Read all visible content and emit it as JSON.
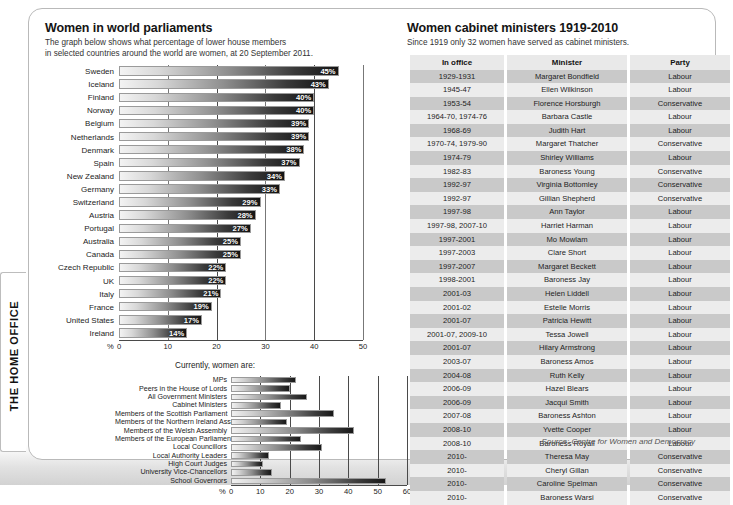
{
  "brand": {
    "tab_label": "THE HOME OFFICE"
  },
  "left": {
    "title": "Women in world parliaments",
    "subtitle_line1": "The graph below shows what percentage of lower house members",
    "subtitle_line2": "in selected countries around the world are women, at 20 September 2011.",
    "sub_caption": "Currently, women are:",
    "axis_unit": "%",
    "source": "Source: Centre for Women and Democracy"
  },
  "right": {
    "title": "Women cabinet ministers 1919-2010",
    "subtitle": "Since 1919 only 32 women have served as cabinet ministers.",
    "columns": [
      "In office",
      "Minister",
      "Party"
    ],
    "rows": [
      [
        "1929-1931",
        "Margaret Bondfield",
        "Labour"
      ],
      [
        "1945-47",
        "Ellen Wilkinson",
        "Labour"
      ],
      [
        "1953-54",
        "Florence Horsburgh",
        "Conservative"
      ],
      [
        "1964-70, 1974-76",
        "Barbara Castle",
        "Labour"
      ],
      [
        "1968-69",
        "Judith Hart",
        "Labour"
      ],
      [
        "1970-74, 1979-90",
        "Margaret Thatcher",
        "Conservative"
      ],
      [
        "1974-79",
        "Shirley Williams",
        "Labour"
      ],
      [
        "1982-83",
        "Baroness Young",
        "Conservative"
      ],
      [
        "1992-97",
        "Virginia Bottomley",
        "Conservative"
      ],
      [
        "1992-97",
        "Gillian Shepherd",
        "Conservative"
      ],
      [
        "1997-98",
        "Ann Taylor",
        "Labour"
      ],
      [
        "1997-98, 2007-10",
        "Harriet Harman",
        "Labour"
      ],
      [
        "1997-2001",
        "Mo Mowlam",
        "Labour"
      ],
      [
        "1997-2003",
        "Clare Short",
        "Labour"
      ],
      [
        "1997-2007",
        "Margaret Beckett",
        "Labour"
      ],
      [
        "1998-2001",
        "Baroness Jay",
        "Labour"
      ],
      [
        "2001-03",
        "Helen Liddell",
        "Labour"
      ],
      [
        "2001-02",
        "Estelle Morris",
        "Labour"
      ],
      [
        "2001-07",
        "Patricia Hewitt",
        "Labour"
      ],
      [
        "2001-07, 2009-10",
        "Tessa Jowell",
        "Labour"
      ],
      [
        "2001-07",
        "Hilary Armstrong",
        "Labour"
      ],
      [
        "2003-07",
        "Baroness Amos",
        "Labour"
      ],
      [
        "2004-08",
        "Ruth Kelly",
        "Labour"
      ],
      [
        "2006-09",
        "Hazel Blears",
        "Labour"
      ],
      [
        "2006-09",
        "Jacqui Smith",
        "Labour"
      ],
      [
        "2007-08",
        "Baroness Ashton",
        "Labour"
      ],
      [
        "2008-10",
        "Yvette Cooper",
        "Labour"
      ],
      [
        "2008-10",
        "Baroness Royall",
        "Labour"
      ],
      [
        "2010-",
        "Theresa May",
        "Conservative"
      ],
      [
        "2010-",
        "Cheryl Gillan",
        "Conservative"
      ],
      [
        "2010-",
        "Caroline Spelman",
        "Conservative"
      ],
      [
        "2010-",
        "Baroness Warsi",
        "Conservative"
      ]
    ]
  },
  "chart_data": [
    {
      "type": "bar",
      "orientation": "horizontal",
      "title": "Women in world parliaments",
      "xlabel": "%",
      "ylabel": "",
      "xlim": [
        0,
        50
      ],
      "xticks": [
        0,
        10,
        20,
        30,
        40,
        50
      ],
      "grid": true,
      "data_labels": true,
      "categories": [
        "Sweden",
        "Iceland",
        "Finland",
        "Norway",
        "Belgium",
        "Netherlands",
        "Denmark",
        "Spain",
        "New Zealand",
        "Germany",
        "Switzerland",
        "Austria",
        "Portugal",
        "Australia",
        "Canada",
        "Czech Republic",
        "UK",
        "Italy",
        "France",
        "United States",
        "Ireland"
      ],
      "values": [
        45,
        43,
        40,
        40,
        39,
        39,
        38,
        37,
        34,
        33,
        29,
        28,
        27,
        25,
        25,
        22,
        22,
        21,
        19,
        17,
        14
      ],
      "value_labels": [
        "45%",
        "43%",
        "40%",
        "40%",
        "39%",
        "39%",
        "38%",
        "37%",
        "34%",
        "33%",
        "29%",
        "28%",
        "27%",
        "25%",
        "25%",
        "22%",
        "22%",
        "21%",
        "19%",
        "17%",
        "14%"
      ]
    },
    {
      "type": "bar",
      "orientation": "horizontal",
      "title": "Currently, women are:",
      "xlabel": "%",
      "ylabel": "",
      "xlim": [
        0,
        60
      ],
      "xticks": [
        0,
        10,
        20,
        30,
        40,
        50,
        60
      ],
      "grid": true,
      "data_labels": false,
      "categories": [
        "MPs",
        "Peers in the House of Lords",
        "All Government Ministers",
        "Cabinet Ministers",
        "Members of the Scottish Parliament",
        "Members of the Northern Ireland Assembly",
        "Members of the Welsh Assembly",
        "Members of the European Parliament",
        "Local Councillors",
        "Local Authority Leaders",
        "High Court Judges",
        "University Vice-Chancellors",
        "School Governors"
      ],
      "values": [
        22,
        20,
        26,
        17,
        35,
        19,
        42,
        24,
        31,
        13,
        11,
        14,
        53
      ]
    }
  ]
}
